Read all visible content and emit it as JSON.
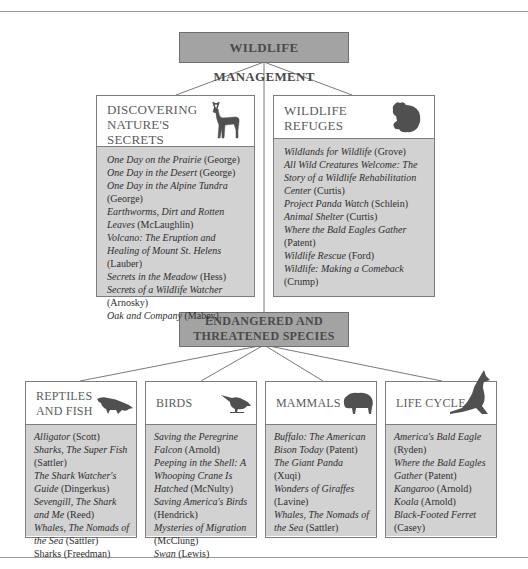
{
  "top": {
    "title": "WILDLIFE MANAGEMENT"
  },
  "middle": {
    "title_line1": "ENDANGERED AND",
    "title_line2": "THREATENED SPECIES"
  },
  "sections": {
    "discovering": {
      "title_lines": [
        "DISCOVERING",
        "NATURE'S",
        "SECRETS"
      ],
      "icon": "deer-icon",
      "entries": [
        {
          "title": "One Day on the Prairie",
          "author": "(George)"
        },
        {
          "title": "One Day in the Desert",
          "author": "(George)"
        },
        {
          "title": "One Day in the Alpine Tundra",
          "author": "(George)"
        },
        {
          "title": "Earthworms, Dirt and Rotten Leaves",
          "author": "(McLaughlin)"
        },
        {
          "title": "Volcano: The Eruption and Healing of Mount St. Helens",
          "author": "(Lauber)"
        },
        {
          "title": "Secrets in the Meadow",
          "author": "(Hess)"
        },
        {
          "title": "Secrets of a Wildlife Watcher",
          "author": "(Arnosky)"
        },
        {
          "title": "Oak and Company",
          "author": "(Mabey)"
        }
      ]
    },
    "refuges": {
      "title_lines": [
        "WILDLIFE",
        "REFUGES"
      ],
      "icon": "bear-icon",
      "entries": [
        {
          "title": "Wildlands for Wildlife",
          "author": "(Grove)"
        },
        {
          "title": "All Wild Creatures Welcome: The Story of a Wildlife Rehabilitation Center",
          "author": "(Curtis)"
        },
        {
          "title": "Project Panda Watch",
          "author": "(Schlein)"
        },
        {
          "title": "Animal Shelter",
          "author": "(Curtis)"
        },
        {
          "title": "Where the Bald Eagles Gather",
          "author": "(Patent)"
        },
        {
          "title": "Wildlife Rescue",
          "author": "(Ford)"
        },
        {
          "title": "Wildlife: Making a Comeback",
          "author": "(Crump)"
        }
      ]
    },
    "reptiles": {
      "title_lines": [
        "REPTILES",
        "AND FISH"
      ],
      "icon": "alligator-icon",
      "entries": [
        {
          "title": "Alligator",
          "author": "(Scott)"
        },
        {
          "title": "Sharks, The Super Fish",
          "author": "(Sattler)"
        },
        {
          "title": "The Shark Watcher's Guide",
          "author": "(Dingerkus)"
        },
        {
          "title": "Sevengill, The Shark and Me",
          "author": "(Reed)"
        },
        {
          "title": "Whales, The Nomads of the Sea",
          "author": "(Sattler)"
        },
        {
          "title": "Sharks",
          "author": "(Freedman)"
        }
      ]
    },
    "birds": {
      "title_lines": [
        "BIRDS"
      ],
      "icon": "bird-icon",
      "entries": [
        {
          "title": "Saving the Peregrine Falcon",
          "author": "(Arnold)"
        },
        {
          "title": "Peeping in the Shell: A Whooping Crane Is Hatched",
          "author": "(McNulty)"
        },
        {
          "title": "Saving America's Birds",
          "author": "(Hendrick)"
        },
        {
          "title": "Mysteries of Migration",
          "author": "(McClung)"
        },
        {
          "title": "Swan",
          "author": "(Lewis)"
        }
      ]
    },
    "mammals": {
      "title_lines": [
        "MAMMALS"
      ],
      "icon": "bison-icon",
      "entries": [
        {
          "title": "Buffalo: The American Bison Today",
          "author": "(Patent)"
        },
        {
          "title": "The Giant Panda",
          "author": "(Xuqi)"
        },
        {
          "title": "Wonders of Giraffes",
          "author": "(Lavine)"
        },
        {
          "title": "Whales, The Nomads of the Sea",
          "author": "(Sattler)"
        }
      ]
    },
    "lifecycle": {
      "title_lines": [
        "LIFE CYCLE"
      ],
      "icon": "kangaroo-icon",
      "entries": [
        {
          "title": "America's Bald Eagle",
          "author": "(Ryden)"
        },
        {
          "title": "Where the Bald Eagles Gather",
          "author": "(Patent)"
        },
        {
          "title": "Kangaroo",
          "author": "(Arnold)"
        },
        {
          "title": "Koala",
          "author": "(Arnold)"
        },
        {
          "title": "Black-Footed Ferret",
          "author": "(Casey)"
        }
      ]
    }
  }
}
